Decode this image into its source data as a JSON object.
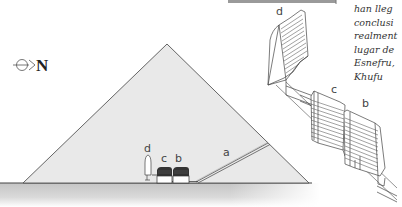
{
  "compass": {
    "label": "N"
  },
  "labels": {
    "cross_section": {
      "a": "a",
      "b": "b",
      "c": "c",
      "d": "d"
    },
    "isometric": {
      "b": "b",
      "c": "c",
      "d": "d"
    }
  },
  "side_text": {
    "lines": [
      "han lleg",
      "conclusi",
      "realment",
      "lugar de",
      "Esnefru,",
      "Khufu"
    ]
  },
  "colors": {
    "pyramid_fill": "#e9e9e9",
    "ground": "#d0d0d0",
    "line": "#555555",
    "top_bar": "#9a9a9a"
  }
}
